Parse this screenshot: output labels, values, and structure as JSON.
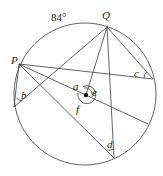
{
  "diagram": {
    "type": "circle-theorems",
    "arc_label": "84°",
    "points": {
      "P": {
        "label": "P",
        "x": 19,
        "y": 64
      },
      "Q": {
        "label": "Q",
        "x": 107,
        "y": 27
      },
      "O": {
        "label": "",
        "x": 86,
        "y": 95
      },
      "B": {
        "x": 14,
        "y": 107
      },
      "C": {
        "x": 153,
        "y": 79
      },
      "D": {
        "x": 114,
        "y": 158
      },
      "E": {
        "x": 148,
        "y": 124
      }
    },
    "angle_labels": {
      "a": "a",
      "b": "b",
      "c": "c",
      "d": "d",
      "e": "e",
      "f": "f"
    },
    "circle": {
      "cx": 85,
      "cy": 94,
      "r": 71
    },
    "colors": {
      "stroke": "#3a3a3a",
      "text": "#231f20",
      "center_dot": "#111111"
    }
  }
}
